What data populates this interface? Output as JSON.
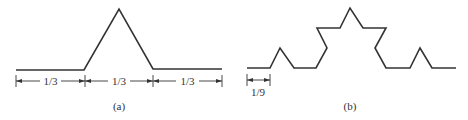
{
  "figure_a": {
    "caption": "(a)",
    "segment_labels": [
      "1/3",
      "1/3",
      "1/3"
    ],
    "description": "Koch curve first iteration: line divided into thirds with middle third replaced by equilateral triangle peak"
  },
  "figure_b": {
    "caption": "(b)",
    "segment_label": "1/9",
    "description": "Koch curve second iteration: each segment of length 1/9"
  },
  "colors": {
    "line": "#333333",
    "background": "#ffffff"
  }
}
